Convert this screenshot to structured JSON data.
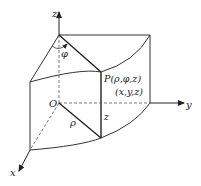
{
  "diagram": {
    "labels": {
      "z_axis": "z",
      "y_axis": "y",
      "x_axis": "x",
      "origin": "O",
      "phi": "φ",
      "rho": "ρ",
      "height": "z",
      "point_cyl": "P(ρ,φ,z)",
      "point_cart": "(x,y,z)"
    },
    "colors": {
      "line": "#333333",
      "dashed": "#555555",
      "background": "#ffffff"
    }
  }
}
